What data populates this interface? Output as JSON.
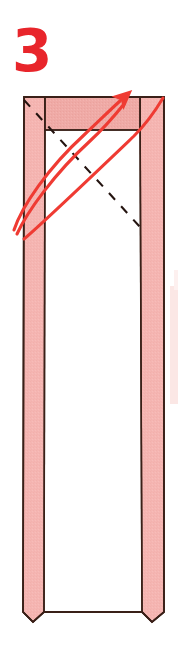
{
  "figure": {
    "kind": "origami-fold-diagram",
    "step_number": "3",
    "caption_sliver": "",
    "alt": "Step 3: fold the flap along the dashed diagonal, swinging the lower-left corner up to the top-right corner."
  },
  "colors": {
    "paper_pink": "#f5b5b2",
    "paper_pink_shadow": "#eaa49f",
    "paper_white": "#ffffff",
    "outline_dark": "#3a2018",
    "fold_dashed": "#241410",
    "arrow_red": "#ef3B33",
    "step_number_red": "#e8252b",
    "ghost_pink": "#fbe6e4",
    "background": "#ffffff"
  },
  "annotations": {
    "arrow_label": "fold-and-swing arrow",
    "dashed_label": "valley fold line",
    "arrow_head_label": "arrow head",
    "arrow_tail_label": "arrow tail"
  },
  "geometry": {
    "model_left": 22,
    "model_right": 165,
    "model_top": 96,
    "model_bottom": 625,
    "left_flap": [
      24,
      45
    ],
    "right_flap": [
      140,
      164
    ],
    "top_band_bottom": 130,
    "dashed_start": [
      24,
      100
    ],
    "dashed_end": [
      140,
      227
    ],
    "arrow_tail": [
      14,
      230
    ],
    "arrow_head": [
      122,
      100
    ],
    "arrow_second_end": [
      163,
      97
    ]
  }
}
